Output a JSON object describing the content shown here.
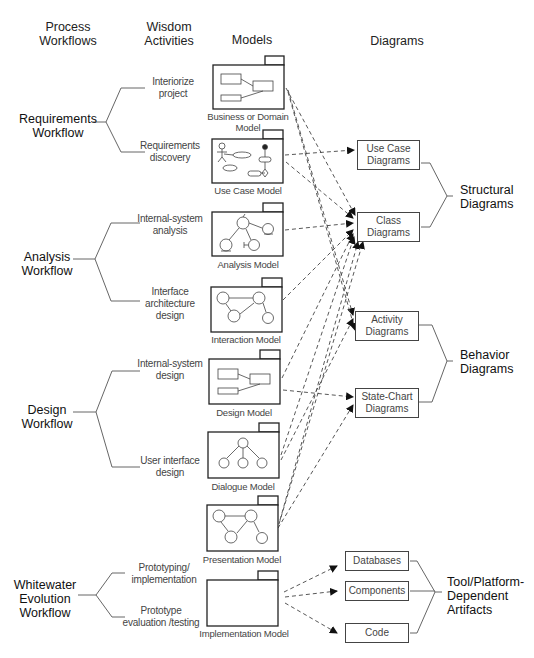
{
  "headers": {
    "process_workflows": "Process\nWorkflows",
    "wisdom_activities": "Wisdom\nActivities",
    "models": "Models",
    "diagrams": "Diagrams"
  },
  "workflows": [
    {
      "label": "Requirements\nWorkflow",
      "activities": [
        "Interiorize\nproject",
        "Requirements\ndiscovery"
      ]
    },
    {
      "label": "Analysis\nWorkflow",
      "activities": [
        "Internal-system\nanalysis",
        "Interface\narchitecture\ndesign"
      ]
    },
    {
      "label": "Design\nWorkflow",
      "activities": [
        "Internal-system\ndesign",
        "User interface\ndesign"
      ]
    },
    {
      "label": "Whitewater\nEvolution\nWorkflow",
      "activities": [
        "Prototyping/\nimplementation",
        "Prototype\nevaluation /testing"
      ]
    }
  ],
  "models": [
    {
      "label": "Business or Domain\nModel",
      "icon": "class-boxes-icon"
    },
    {
      "label": "Use Case Model",
      "icon": "use-case-icon"
    },
    {
      "label": "Analysis Model",
      "icon": "analysis-objects-icon"
    },
    {
      "label": "Interaction Model",
      "icon": "interaction-objects-icon"
    },
    {
      "label": "Design Model",
      "icon": "class-boxes-icon"
    },
    {
      "label": "Dialogue Model",
      "icon": "dialogue-tree-icon"
    },
    {
      "label": "Presentation Model",
      "icon": "presentation-objects-icon"
    },
    {
      "label": "Implementation Model",
      "icon": "empty-package-icon"
    }
  ],
  "diagrams": [
    {
      "label": "Use Case\nDiagrams"
    },
    {
      "label": "Class\nDiagrams"
    },
    {
      "label": "Activity\nDiagrams"
    },
    {
      "label": "State-Chart\nDiagrams"
    }
  ],
  "artifacts": [
    {
      "label": "Databases"
    },
    {
      "label": "Components"
    },
    {
      "label": "Code"
    }
  ],
  "groups": {
    "structural": "Structural\nDiagrams",
    "behavior": "Behavior\nDiagrams",
    "tool_platform": "Tool/Platform-\nDependent\nArtifacts"
  },
  "colors": {
    "line": "#555555",
    "box_border": "#444444",
    "text": "#222222"
  }
}
